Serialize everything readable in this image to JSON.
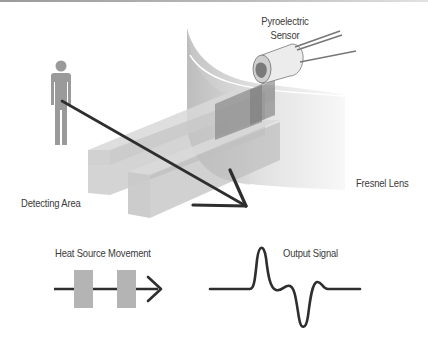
{
  "diagram": {
    "labels": {
      "sensor_line1": "Pyroelectric",
      "sensor_line2": "Sensor",
      "lens": "Fresnel Lens",
      "detecting_area": "Detecting Area",
      "heat_source": "Heat Source Movement",
      "output_signal": "Output Signal"
    },
    "icons": {
      "person": "person-icon",
      "sensor": "pyroelectric-sensor-icon",
      "lens": "fresnel-lens-shape",
      "arrow": "movement-arrow-icon",
      "waveform": "output-waveform"
    },
    "colors": {
      "line": "#2e2e2e",
      "person": "#9a9a9a",
      "beam": "#c9c9c9",
      "beam_dark": "#8e8e8e",
      "lens": "#d6d6d6",
      "text": "#3a3a3a",
      "block": "#b4b4b4"
    }
  }
}
